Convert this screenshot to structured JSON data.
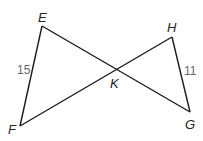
{
  "diagram": {
    "type": "geometry-figure",
    "points": {
      "E": {
        "label": "E",
        "x": 42,
        "y": 26
      },
      "F": {
        "label": "F",
        "x": 20,
        "y": 126
      },
      "H": {
        "label": "H",
        "x": 172,
        "y": 37
      },
      "G": {
        "label": "G",
        "x": 190,
        "y": 112
      },
      "K": {
        "label": "K",
        "x": 115,
        "y": 70
      }
    },
    "segments": [
      {
        "from": "E",
        "to": "F"
      },
      {
        "from": "E",
        "to": "G"
      },
      {
        "from": "F",
        "to": "H"
      },
      {
        "from": "H",
        "to": "G"
      }
    ],
    "measures": {
      "EF": "15",
      "HG": "11"
    },
    "colors": {
      "line": "#1a1a1a",
      "vertex_label": "#222222",
      "measure_label": "#666666"
    }
  }
}
